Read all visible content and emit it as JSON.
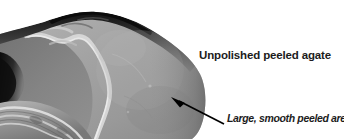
{
  "figure": {
    "type": "annotated-photograph",
    "background_color": "#ffffff",
    "photo": {
      "name": "unpolished-peeled-agate-photo",
      "palette": {
        "background": "#ffffff",
        "rim_dark": "#1a1a1a",
        "shadow_dark": "#2e2e2e",
        "inner_mid": "#7d7d7d",
        "peeled_surface": "#9c9c9c",
        "peeled_highlight": "#b4b4b4",
        "ridge_light": "#d2d2d2",
        "band_light": "#c8c8c8"
      }
    },
    "labels": {
      "heading": "Unpolished peeled agate",
      "caption": "Large, smooth peeled area"
    },
    "arrow": {
      "name": "leader-arrow",
      "color": "#000000",
      "tail_x": 224,
      "tail_y": 124,
      "tip_x": 171,
      "tip_y": 97
    }
  }
}
